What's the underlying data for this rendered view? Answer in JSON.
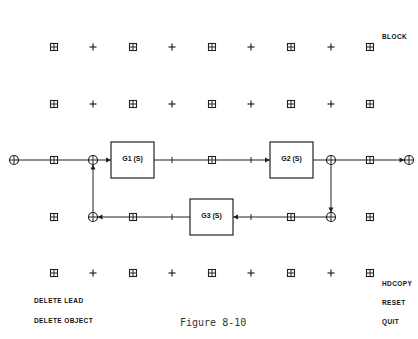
{
  "canvas": {
    "grid_columns_x": [
      54,
      93,
      133,
      172,
      212,
      251,
      291,
      331,
      370
    ],
    "grid_rows_y": [
      47,
      104,
      160,
      217,
      273
    ],
    "grid_markers": "alternating boxed-cross and plus markers"
  },
  "blocks": [
    {
      "id": "G1",
      "label": "G1 (S)",
      "x": 111,
      "y": 142,
      "w": 43,
      "h": 36
    },
    {
      "id": "G2",
      "label": "G2 (S)",
      "x": 270,
      "y": 142,
      "w": 43,
      "h": 36
    },
    {
      "id": "G3",
      "label": "G3 (S)",
      "x": 190,
      "y": 199,
      "w": 43,
      "h": 36
    }
  ],
  "nodes": {
    "input": {
      "x": 14,
      "y": 160
    },
    "summing_top": {
      "x": 93,
      "y": 160
    },
    "takeoff_right": {
      "x": 331,
      "y": 160
    },
    "summing_bottom_right": {
      "x": 331,
      "y": 217
    },
    "summing_bottom_left": {
      "x": 93,
      "y": 217
    },
    "output": {
      "x": 409,
      "y": 160
    }
  },
  "menu": {
    "right": [
      {
        "label": "BLOCK",
        "x": 382,
        "y": 33
      },
      {
        "label": "HDCOPY",
        "x": 382,
        "y": 280
      },
      {
        "label": "RESET",
        "x": 382,
        "y": 299
      },
      {
        "label": "QUIT",
        "x": 382,
        "y": 318
      }
    ],
    "left": [
      {
        "label": "DELETE LEAD",
        "x": 34,
        "y": 297
      },
      {
        "label": "DELETE OBJECT",
        "x": 34,
        "y": 317
      }
    ]
  },
  "caption": "Figure 8-10"
}
